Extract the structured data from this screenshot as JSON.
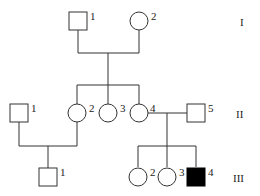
{
  "pedigree": {
    "generations": [
      "I",
      "II",
      "III"
    ],
    "individuals": {
      "I1": {
        "label": "1",
        "sex": "male",
        "affected": false
      },
      "I2": {
        "label": "2",
        "sex": "female",
        "affected": false
      },
      "II1": {
        "label": "1",
        "sex": "male",
        "affected": false
      },
      "II2": {
        "label": "2",
        "sex": "female",
        "affected": false
      },
      "II3": {
        "label": "3",
        "sex": "female",
        "affected": false
      },
      "II4": {
        "label": "4",
        "sex": "female",
        "affected": false
      },
      "II5": {
        "label": "5",
        "sex": "male",
        "affected": false
      },
      "III1": {
        "label": "1",
        "sex": "male",
        "affected": false
      },
      "III2": {
        "label": "2",
        "sex": "female",
        "affected": false
      },
      "III3": {
        "label": "3",
        "sex": "female",
        "affected": false
      },
      "III4": {
        "label": "4",
        "sex": "male",
        "affected": true
      }
    },
    "colors": {
      "line": "#333333",
      "affected_fill": "#000000",
      "unaffected_fill": "#ffffff"
    }
  }
}
